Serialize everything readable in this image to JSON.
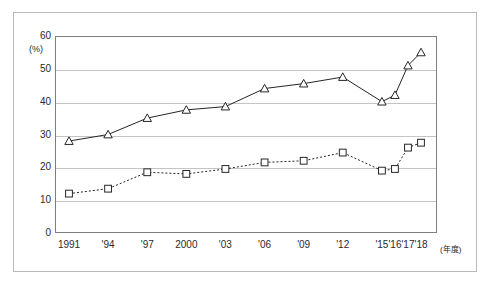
{
  "figure": {
    "caption_clipped": "",
    "y_unit": "(%)",
    "x_unit": "(年度)"
  },
  "chart_data": {
    "type": "line",
    "title": "",
    "subtitle": "",
    "xlabel": "(年度)",
    "ylabel": "(%)",
    "ylim": [
      0,
      60
    ],
    "yticks": [
      0,
      10,
      20,
      30,
      40,
      50,
      60
    ],
    "ytick_labels": [
      "0",
      "10",
      "20",
      "30",
      "40",
      "50",
      "60"
    ],
    "grid": true,
    "grid_axis": "y",
    "legend": "none",
    "categories": [
      "1991",
      "'94",
      "'97",
      "2000",
      "'03",
      "'06",
      "'09",
      "'12",
      "'15",
      "'16",
      "'17",
      "'18"
    ],
    "x_positions": [
      0.0,
      0.333,
      0.667,
      1.0,
      1.333,
      1.667,
      2.0,
      2.333,
      2.667,
      2.778,
      2.889,
      3.0
    ],
    "series": [
      {
        "name": "triangle-series",
        "marker": "triangle-up-open",
        "line_style": "solid",
        "color": "#262626",
        "values": [
          28.0,
          30.0,
          35.0,
          37.5,
          38.5,
          44.0,
          45.5,
          47.5,
          40.0,
          42.0,
          51.0,
          55.0
        ]
      },
      {
        "name": "square-series",
        "marker": "square-open",
        "line_style": "dotted",
        "color": "#262626",
        "values": [
          12.0,
          13.5,
          18.5,
          18.0,
          19.5,
          21.5,
          22.0,
          24.5,
          19.0,
          19.5,
          26.0,
          27.5
        ]
      }
    ]
  }
}
